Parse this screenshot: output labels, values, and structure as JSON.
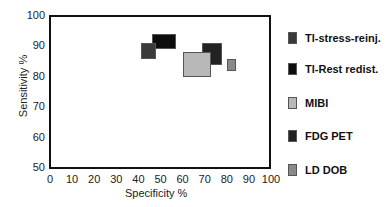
{
  "chart_data": {
    "type": "scatter",
    "title": "",
    "xlabel": "Specificity %",
    "ylabel": "Sensitivity %",
    "xlim": [
      0,
      100
    ],
    "ylim": [
      50,
      100
    ],
    "x_ticks": [
      "0",
      "10",
      "20",
      "30",
      "40",
      "50",
      "60",
      "70",
      "80",
      "90",
      "100"
    ],
    "y_ticks": [
      "100",
      "90",
      "80",
      "70",
      "60",
      "50"
    ],
    "grid": false,
    "legend_position": "right",
    "series": [
      {
        "name": "Tl-stress-reinj.",
        "color": "#3a3a3a",
        "spec_range": [
          41,
          48
        ],
        "sens_range": [
          86,
          91
        ]
      },
      {
        "name": "Tl-Rest redist.",
        "color": "#0d0d0d",
        "spec_range": [
          46,
          57
        ],
        "sens_range": [
          89,
          94
        ]
      },
      {
        "name": "MIBI",
        "color": "#b8b8b8",
        "spec_range": [
          60,
          73
        ],
        "sens_range": [
          80,
          88
        ]
      },
      {
        "name": "FDG PET",
        "color": "#222222",
        "spec_range": [
          69,
          78
        ],
        "sens_range": [
          84,
          91
        ]
      },
      {
        "name": "LD DOB",
        "color": "#8a8a8a",
        "spec_range": [
          80,
          84
        ],
        "sens_range": [
          82,
          86
        ]
      }
    ]
  }
}
